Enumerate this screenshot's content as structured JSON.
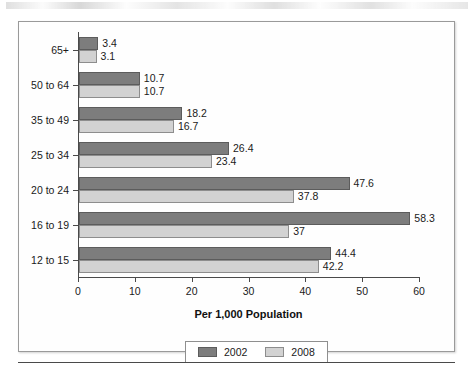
{
  "chart_data": {
    "type": "bar",
    "orientation": "horizontal",
    "title": "",
    "xlabel": "Per 1,000 Population",
    "ylabel": "",
    "xlim": [
      0,
      60
    ],
    "xticks": [
      0,
      10,
      20,
      30,
      40,
      50,
      60
    ],
    "grid": false,
    "legend_position": "bottom",
    "categories": [
      "65+",
      "50 to 64",
      "35 to 49",
      "25 to 34",
      "20 to 24",
      "16 to 19",
      "12 to 15"
    ],
    "series": [
      {
        "name": "2002",
        "color": "#7d7d7d",
        "values": [
          3.4,
          10.7,
          18.2,
          26.4,
          47.6,
          58.3,
          44.4
        ],
        "labels": [
          "3.4",
          "10.7",
          "18.2",
          "26.4",
          "47.6",
          "58.3",
          "44.4"
        ]
      },
      {
        "name": "2008",
        "color": "#d2d2d2",
        "values": [
          3.1,
          10.7,
          16.7,
          23.4,
          37.8,
          37,
          42.2
        ],
        "labels": [
          "3.1",
          "10.7",
          "16.7",
          "23.4",
          "37.8",
          "37",
          "42.2"
        ]
      }
    ]
  },
  "legend": {
    "items": [
      {
        "label": "2002",
        "swatch": "series-2002-swatch"
      },
      {
        "label": "2008",
        "swatch": "series-2008-swatch"
      }
    ]
  }
}
